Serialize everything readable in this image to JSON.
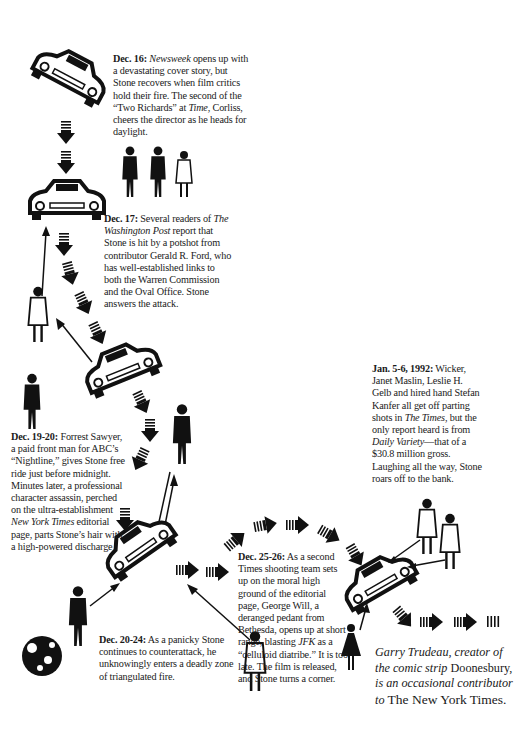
{
  "entries": [
    {
      "id": "dec16",
      "date": "Dec. 16:",
      "lines": [
        "Newsweek opens up with a devastating cover story, but Stone recovers when film critics hold their fire. The second of the “Two Richards” at Time, Corliss, cheers the director as he heads for daylight."
      ],
      "parts": {
        "pre": "",
        "pub1": "Newsweek",
        "mid1": " opens up with a devastating  cover story, but Stone recovers when film critics hold their fire. The second of the “Two Richards” at ",
        "pub2": "Time",
        "post": ", Corliss, cheers the director as he heads for daylight."
      }
    },
    {
      "id": "dec17",
      "date": "Dec. 17:",
      "parts": {
        "pre": " Several readers of ",
        "pub1": "The Washington Post",
        "post": " report that Stone is hit by a potshot from contributor Gerald R. Ford, who has well-established links to both the Warren Commission and the Oval Office. Stone answers the attack."
      }
    },
    {
      "id": "dec1920",
      "date": "Dec. 19-20:",
      "parts": {
        "pre": " Forrest Sawyer, a paid front man for ABC’s “Nightline,” gives Stone free ride just before midnight. Minutes later, a professional character assassin, perched on the ultra-establishment ",
        "pub1": "New York Times",
        "post": " editorial page, parts Stone’s hair with a high-powered discharge ."
      }
    },
    {
      "id": "dec2024",
      "date": "Dec. 20-24:",
      "parts": {
        "pre": " As a panicky Stone continues to counterattack, he unknowingly enters a deadly zone of triangulated fire."
      }
    },
    {
      "id": "dec2526",
      "date": "Dec. 25-26:",
      "parts": {
        "pre": " As a second Times shooting team sets up on the moral high ground of the editorial page, George Will, a deranged pedant from Bethesda, opens up at short range, blasting ",
        "pub1": "JFK",
        "post": " as a “celluloid diatribe.” It is too late. The film is released, and Stone turns a corner."
      }
    },
    {
      "id": "jan56",
      "date": "Jan. 5-6, 1992:",
      "parts": {
        "pre": " Wicker, Janet Maslin, Leslie H. Gelb and hired hand Stefan Kanfer all get off parting shots in ",
        "pub1": "The Times",
        "mid1": ", but the only report heard is from ",
        "pub2": "Daily Variety",
        "post": "—that of a $30.8 million gross. Laughing all the way, Stone roars off to the bank."
      }
    }
  ],
  "credit": {
    "line1": "Garry Trudeau, creator of the comic strip",
    "strip": "Doonesbury,",
    "line2": " is an occasional contributor to",
    "paper": "The New York Times."
  },
  "illustration": {
    "cars": 6,
    "figures": [
      "camera crew trio",
      "man in coat",
      "man with cane",
      "plaid-shirt man",
      "standing man",
      "woman in coat",
      "two men at right",
      "woman in skirt"
    ],
    "colors": {
      "ink": "#111111",
      "paper": "#ffffff"
    }
  }
}
